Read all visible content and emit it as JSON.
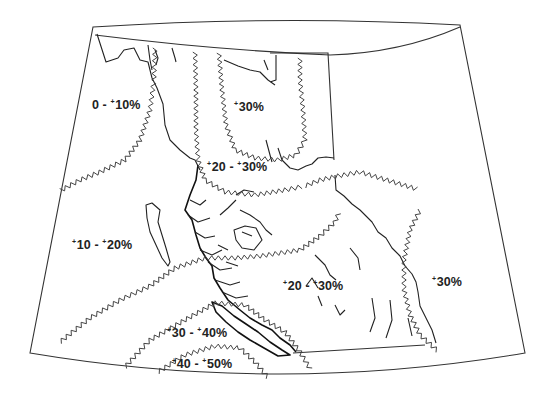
{
  "map": {
    "region": "British Columbia and surrounding area",
    "line_color": "#222222",
    "background": "#ffffff",
    "zones": [
      {
        "id": "z0-10",
        "low": "0",
        "high": "10",
        "label_parts": [
          "0 - ",
          "+",
          "10%"
        ]
      },
      {
        "id": "z30-north",
        "low": "30",
        "high": null,
        "label_parts": [
          "",
          "+",
          "30%"
        ]
      },
      {
        "id": "z20-30-north",
        "low": "20",
        "high": "30",
        "label_parts": [
          "",
          "+",
          "20 - ",
          "+",
          "30%"
        ]
      },
      {
        "id": "z10-20",
        "low": "10",
        "high": "20",
        "label_parts": [
          "",
          "+",
          "10 - ",
          "+",
          "20%"
        ]
      },
      {
        "id": "z20-30-south",
        "low": "20",
        "high": "30",
        "label_parts": [
          "",
          "+",
          "20 - ",
          "+",
          "30%"
        ]
      },
      {
        "id": "z30-east",
        "low": "30",
        "high": null,
        "label_parts": [
          "",
          "+",
          "30%"
        ]
      },
      {
        "id": "z30-40",
        "low": "30",
        "high": "40",
        "label_parts": [
          "",
          "+",
          "30 - ",
          "+",
          "40%"
        ]
      },
      {
        "id": "z40-50",
        "low": "40",
        "high": "50",
        "label_parts": [
          "",
          "+",
          "40 - ",
          "+",
          "50%"
        ]
      }
    ],
    "labels": {
      "z0_10": "0 - +10%",
      "z30_north": "+30%",
      "z20_30_north": "+20 - +30%",
      "z10_20": "+10 - +20%",
      "z20_30_south": "+20 - +30%",
      "z30_east": "+30%",
      "z30_40": "+30 - +40%",
      "z40_50": "+40 - +50%"
    }
  }
}
